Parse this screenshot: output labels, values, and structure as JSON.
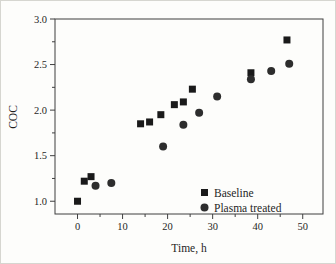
{
  "figure": {
    "background": "#fdfdfb",
    "border_color": "#d6d6d0",
    "axis_color": "#3f3f3f",
    "text_color": "#1f1f1f"
  },
  "chart_data": {
    "type": "scatter",
    "title": "",
    "xlabel": "Time, h",
    "ylabel": "COC",
    "xlim": [
      -5,
      54.5
    ],
    "ylim": [
      0.86,
      3.0
    ],
    "grid": false,
    "legend_position": "lower-right",
    "x_ticks": [
      {
        "v": 0,
        "label": "0"
      },
      {
        "v": 10,
        "label": "10"
      },
      {
        "v": 20,
        "label": "20"
      },
      {
        "v": 30,
        "label": "30"
      },
      {
        "v": 40,
        "label": "40"
      },
      {
        "v": 50,
        "label": "50"
      }
    ],
    "x_minor_ticks": [
      5,
      15,
      25,
      35,
      45
    ],
    "y_ticks": [
      {
        "v": 1.0,
        "label": "1.0"
      },
      {
        "v": 1.5,
        "label": "1.5"
      },
      {
        "v": 2.0,
        "label": "2.0"
      },
      {
        "v": 2.5,
        "label": "2.5"
      },
      {
        "v": 3.0,
        "label": "3.0"
      }
    ],
    "y_minor_ticks": [
      1.25,
      1.75,
      2.25,
      2.75
    ],
    "series": [
      {
        "name": "Baseline",
        "marker": "square",
        "color": "#1a1a1a",
        "points": [
          [
            0,
            1.0
          ],
          [
            1.5,
            1.22
          ],
          [
            3,
            1.27
          ],
          [
            14,
            1.85
          ],
          [
            16,
            1.87
          ],
          [
            18.5,
            1.95
          ],
          [
            21.5,
            2.06
          ],
          [
            23.5,
            2.09
          ],
          [
            25.5,
            2.23
          ],
          [
            38.5,
            2.41
          ],
          [
            46.5,
            2.77
          ]
        ]
      },
      {
        "name": "Plasma treated",
        "marker": "circle",
        "color": "#2d2d2d",
        "points": [
          [
            4,
            1.17
          ],
          [
            7.5,
            1.2
          ],
          [
            19,
            1.6
          ],
          [
            23.5,
            1.84
          ],
          [
            27,
            1.97
          ],
          [
            31,
            2.15
          ],
          [
            38.5,
            2.34
          ],
          [
            43,
            2.43
          ],
          [
            47,
            2.51
          ]
        ]
      }
    ]
  }
}
